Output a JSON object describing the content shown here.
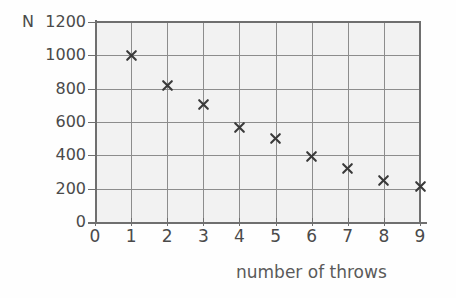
{
  "chart_data": {
    "type": "scatter",
    "title": "",
    "subtitle": "",
    "xlabel": "number of throws",
    "ylabel": "N",
    "x": [
      1,
      2,
      3,
      4,
      5,
      6,
      7,
      8,
      9
    ],
    "values": [
      1000,
      820,
      705,
      570,
      500,
      395,
      320,
      250,
      215
    ],
    "series": [
      {
        "name": "N",
        "x": [
          1,
          2,
          3,
          4,
          5,
          6,
          7,
          8,
          9
        ],
        "values": [
          1000,
          820,
          705,
          570,
          500,
          395,
          320,
          250,
          215
        ]
      }
    ],
    "xlim": [
      0,
      9
    ],
    "ylim": [
      0,
      1200
    ],
    "x_ticks": [
      0,
      1,
      2,
      3,
      4,
      5,
      6,
      7,
      8,
      9
    ],
    "y_ticks": [
      0,
      200,
      400,
      600,
      800,
      1000,
      1200
    ],
    "x_tick_labels": [
      "0",
      "1",
      "2",
      "3",
      "4",
      "5",
      "6",
      "7",
      "8",
      "9"
    ],
    "y_tick_labels": [
      "0",
      "200",
      "400",
      "600",
      "800",
      "1000",
      "1200"
    ],
    "grid": true,
    "legend": false,
    "legend_position": "none",
    "marker": "x",
    "marker_color": "#3a3a3a",
    "plot_background": "#f2f2f2",
    "grid_color": "#8d8d8d",
    "axis_color": "#6f6f6f",
    "annotations": []
  },
  "axes": {
    "y_name": "N",
    "x_title": "number of throws"
  }
}
